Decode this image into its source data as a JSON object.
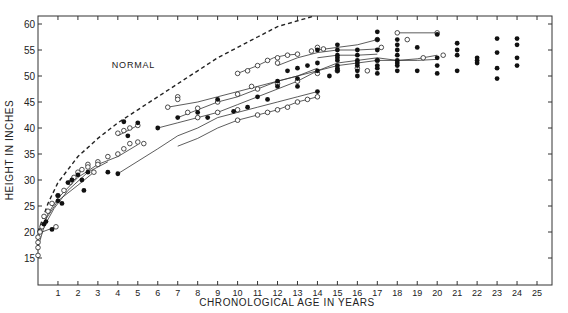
{
  "chart_data": {
    "type": "scatter",
    "title": "",
    "xlabel": "CHRONOLOGICAL AGE IN YEARS",
    "ylabel": "HEIGHT IN INCHES",
    "xlim": [
      0,
      25
    ],
    "ylim": [
      10,
      62
    ],
    "x_ticks": [
      1,
      2,
      3,
      4,
      5,
      6,
      7,
      8,
      9,
      10,
      11,
      12,
      13,
      14,
      15,
      16,
      17,
      18,
      19,
      20,
      21,
      22,
      23,
      24,
      25
    ],
    "y_ticks": [
      15,
      20,
      25,
      30,
      35,
      40,
      45,
      50,
      55,
      60
    ],
    "grid": false,
    "annotations": [
      {
        "text": "NORMAL",
        "x": 4.7,
        "y": 51.5
      }
    ],
    "series": [
      {
        "name": "NORMAL",
        "style": "dashed-curve",
        "points": [
          [
            0,
            20
          ],
          [
            0.5,
            25.5
          ],
          [
            1,
            29.5
          ],
          [
            2,
            34.5
          ],
          [
            3,
            38
          ],
          [
            4,
            41
          ],
          [
            5,
            43.5
          ],
          [
            6,
            46
          ],
          [
            7,
            48.5
          ],
          [
            8,
            51
          ],
          [
            9,
            53.5
          ],
          [
            10,
            55.5
          ],
          [
            11,
            57.5
          ],
          [
            12,
            59.5
          ],
          [
            13.8,
            61.5
          ]
        ]
      },
      {
        "name": "patient-curves",
        "style": "solid-lines",
        "lines": [
          [
            [
              0,
              17
            ],
            [
              0.3,
              21
            ],
            [
              0.8,
              24.5
            ],
            [
              1.5,
              28
            ],
            [
              2.5,
              31.5
            ],
            [
              3.5,
              33.5
            ]
          ],
          [
            [
              0,
              19
            ],
            [
              0.5,
              23.5
            ],
            [
              1,
              26.5
            ],
            [
              2,
              30.5
            ],
            [
              3,
              33
            ],
            [
              4,
              34.5
            ],
            [
              5,
              36.8
            ]
          ],
          [
            [
              0,
              20
            ],
            [
              0.4,
              22.5
            ],
            [
              1,
              26
            ],
            [
              2,
              29
            ],
            [
              2.8,
              31.5
            ]
          ],
          [
            [
              0.2,
              20
            ],
            [
              0.9,
              21
            ]
          ],
          [
            [
              4,
              31.2
            ],
            [
              6,
              36
            ],
            [
              7,
              38.5
            ],
            [
              8,
              40
            ],
            [
              9,
              42
            ],
            [
              10,
              43
            ],
            [
              11,
              44
            ],
            [
              12,
              45
            ],
            [
              13,
              46
            ],
            [
              14,
              47
            ]
          ],
          [
            [
              7,
              36.5
            ],
            [
              8,
              38
            ],
            [
              9,
              40
            ],
            [
              10,
              41.5
            ],
            [
              11,
              42.5
            ],
            [
              12,
              43.5
            ],
            [
              13,
              45
            ],
            [
              14,
              46
            ]
          ],
          [
            [
              6,
              40
            ],
            [
              7,
              41
            ],
            [
              8,
              42
            ],
            [
              9,
              43
            ],
            [
              10,
              44.5
            ],
            [
              11,
              46
            ],
            [
              12,
              47.5
            ],
            [
              13,
              49
            ],
            [
              14,
              51
            ],
            [
              15,
              52.5
            ],
            [
              16,
              53
            ],
            [
              17,
              53.5
            ],
            [
              18,
              53
            ],
            [
              19,
              53
            ],
            [
              20,
              53.2
            ]
          ],
          [
            [
              7,
              42
            ],
            [
              8,
              43.5
            ],
            [
              9,
              45
            ],
            [
              10,
              46
            ],
            [
              11,
              47.5
            ],
            [
              12,
              49
            ],
            [
              13,
              50
            ],
            [
              14,
              51
            ],
            [
              15,
              52
            ],
            [
              16,
              52.5
            ],
            [
              17,
              53
            ],
            [
              18,
              53
            ],
            [
              19,
              53.3
            ],
            [
              20,
              54
            ]
          ],
          [
            [
              6.5,
              44
            ],
            [
              8,
              45
            ],
            [
              9,
              46
            ],
            [
              10,
              47
            ],
            [
              11,
              48
            ],
            [
              12,
              49
            ],
            [
              13,
              50
            ],
            [
              14,
              51.5
            ]
          ],
          [
            [
              10,
              50.5
            ],
            [
              11,
              52
            ],
            [
              11.8,
              53.5
            ],
            [
              12.4,
              54
            ],
            [
              13,
              54.2
            ]
          ],
          [
            [
              12,
              52
            ],
            [
              13,
              53.5
            ],
            [
              14,
              54.5
            ],
            [
              15,
              55
            ],
            [
              16,
              55
            ],
            [
              17,
              55.2
            ]
          ],
          [
            [
              14,
              55
            ],
            [
              15,
              55.5
            ],
            [
              16,
              56
            ],
            [
              17,
              57
            ]
          ],
          [
            [
              18,
              58.3
            ],
            [
              20,
              58.3
            ]
          ],
          [
            [
              14,
              53.5
            ],
            [
              15,
              54
            ],
            [
              16,
              54
            ],
            [
              17,
              54.2
            ]
          ],
          [
            [
              4,
              38.5
            ],
            [
              5,
              40.5
            ]
          ]
        ]
      },
      {
        "name": "open-circles",
        "marker": "open",
        "points": [
          [
            0,
            15.5
          ],
          [
            0,
            17
          ],
          [
            0,
            18
          ],
          [
            0,
            19
          ],
          [
            0.1,
            20
          ],
          [
            0.2,
            21
          ],
          [
            0.3,
            23
          ],
          [
            0.5,
            24
          ],
          [
            0.7,
            25.5
          ],
          [
            0.9,
            21
          ],
          [
            1,
            27
          ],
          [
            1.3,
            28
          ],
          [
            1.6,
            29.5
          ],
          [
            1.8,
            30.5
          ],
          [
            2,
            31.5
          ],
          [
            2.2,
            32
          ],
          [
            2.5,
            33
          ],
          [
            2.8,
            31.5
          ],
          [
            3,
            33.5
          ],
          [
            3.5,
            34.5
          ],
          [
            4,
            35
          ],
          [
            4.3,
            36
          ],
          [
            4.6,
            37
          ],
          [
            5,
            37.3
          ],
          [
            5.3,
            37
          ],
          [
            4,
            39
          ],
          [
            4.3,
            39.5
          ],
          [
            4.6,
            40
          ],
          [
            5,
            40.5
          ],
          [
            6.5,
            44
          ],
          [
            7,
            46
          ],
          [
            7,
            45.5
          ],
          [
            7.5,
            43
          ],
          [
            8,
            42
          ],
          [
            9,
            43
          ],
          [
            10,
            43.5
          ],
          [
            10,
            41.5
          ],
          [
            11,
            42.5
          ],
          [
            11.5,
            43
          ],
          [
            12,
            43.5
          ],
          [
            12.5,
            44
          ],
          [
            13,
            45
          ],
          [
            13.5,
            45.5
          ],
          [
            14,
            46
          ],
          [
            9,
            45
          ],
          [
            10,
            46.5
          ],
          [
            11,
            47.5
          ],
          [
            12,
            48.5
          ],
          [
            10,
            50.5
          ],
          [
            10.5,
            51
          ],
          [
            11,
            52
          ],
          [
            11.5,
            53
          ],
          [
            12,
            53.5
          ],
          [
            12.5,
            54
          ],
          [
            13,
            54.2
          ],
          [
            10.7,
            48
          ],
          [
            12,
            52.5
          ],
          [
            13,
            49
          ],
          [
            14,
            50.5
          ],
          [
            15,
            51
          ],
          [
            16,
            51.5
          ],
          [
            17,
            53
          ],
          [
            13.7,
            54.8
          ],
          [
            14.3,
            55.2
          ],
          [
            17,
            57
          ],
          [
            17.2,
            55.5
          ],
          [
            18,
            58.3
          ],
          [
            18.5,
            57
          ],
          [
            20,
            58.3
          ],
          [
            20.3,
            54
          ],
          [
            19.3,
            53.5
          ],
          [
            16.5,
            51
          ],
          [
            14,
            55.5
          ],
          [
            8,
            43.8
          ],
          [
            3,
            33
          ],
          [
            2.5,
            32.5
          ]
        ]
      },
      {
        "name": "filled-circles",
        "marker": "filled",
        "points": [
          [
            0.3,
            21.5
          ],
          [
            0.4,
            22
          ],
          [
            0.7,
            20.5
          ],
          [
            1,
            26
          ],
          [
            1,
            27
          ],
          [
            1.5,
            29.5
          ],
          [
            1.7,
            30
          ],
          [
            2,
            31
          ],
          [
            2.2,
            30
          ],
          [
            2.5,
            31.5
          ],
          [
            3.5,
            31.5
          ],
          [
            2.3,
            28
          ],
          [
            1.2,
            25.5
          ],
          [
            4,
            31.2
          ],
          [
            4.5,
            38.5
          ],
          [
            4.3,
            41.2
          ],
          [
            5,
            41
          ],
          [
            6,
            40
          ],
          [
            7,
            42
          ],
          [
            8,
            43
          ],
          [
            8.5,
            42
          ],
          [
            9,
            45.5
          ],
          [
            9.8,
            43.2
          ],
          [
            10.5,
            44
          ],
          [
            11,
            46
          ],
          [
            11.5,
            45.5
          ],
          [
            12,
            48
          ],
          [
            12,
            49
          ],
          [
            12.5,
            51
          ],
          [
            13,
            49.5
          ],
          [
            13,
            48
          ],
          [
            13,
            51.5
          ],
          [
            13.5,
            52
          ],
          [
            14,
            47
          ],
          [
            14,
            51
          ],
          [
            14,
            52.5
          ],
          [
            14,
            55
          ],
          [
            14.6,
            50
          ],
          [
            15,
            51
          ],
          [
            15,
            52
          ],
          [
            15,
            53
          ],
          [
            15,
            54
          ],
          [
            15,
            55
          ],
          [
            15,
            56
          ],
          [
            15,
            51.5
          ],
          [
            15,
            53.5
          ],
          [
            16,
            50
          ],
          [
            16,
            51
          ],
          [
            16,
            52
          ],
          [
            16,
            53
          ],
          [
            16,
            54
          ],
          [
            16,
            55
          ],
          [
            16,
            52.5
          ],
          [
            17,
            50.5
          ],
          [
            17,
            51.5
          ],
          [
            17,
            52
          ],
          [
            17,
            53
          ],
          [
            17,
            55
          ],
          [
            17,
            57
          ],
          [
            17,
            58.5
          ],
          [
            18,
            51
          ],
          [
            18,
            52
          ],
          [
            18,
            53
          ],
          [
            18,
            54
          ],
          [
            18,
            55
          ],
          [
            18,
            56
          ],
          [
            18,
            57
          ],
          [
            18,
            52.5
          ],
          [
            19,
            51
          ],
          [
            19,
            55.5
          ],
          [
            20,
            50.5
          ],
          [
            20,
            52
          ],
          [
            20,
            53.5
          ],
          [
            20,
            58
          ],
          [
            21,
            51
          ],
          [
            21,
            54
          ],
          [
            21,
            55
          ],
          [
            21,
            56.3
          ],
          [
            22,
            52.5
          ],
          [
            22,
            53
          ],
          [
            22,
            53.5
          ],
          [
            23,
            49.5
          ],
          [
            23,
            51.5
          ],
          [
            23,
            54.5
          ],
          [
            23,
            57.2
          ],
          [
            24,
            52
          ],
          [
            24,
            53.5
          ],
          [
            24,
            56
          ],
          [
            24,
            57.2
          ]
        ]
      }
    ]
  }
}
